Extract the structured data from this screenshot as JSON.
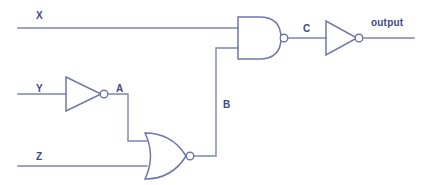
{
  "diagram": {
    "colors": {
      "wire": "#7b85b5",
      "gate_outline": "#6d77ad",
      "label_text": "#3c4a86",
      "background": "#ffffff"
    },
    "inputs": [
      {
        "id": "x",
        "label": "X",
        "x": 36,
        "y": 11,
        "wire_y": 28
      },
      {
        "id": "y",
        "label": "Y",
        "x": 36,
        "y": 84,
        "wire_y": 94
      },
      {
        "id": "z",
        "label": "Z",
        "x": 36,
        "y": 152,
        "wire_y": 166
      }
    ],
    "nodes": [
      {
        "id": "a",
        "label": "A",
        "x": 116,
        "y": 84
      },
      {
        "id": "b",
        "label": "B",
        "x": 223,
        "y": 100
      },
      {
        "id": "c",
        "label": "C",
        "x": 303,
        "y": 24
      }
    ],
    "outputs": [
      {
        "id": "output",
        "label": "output",
        "x": 371,
        "y": 18
      }
    ],
    "gates": [
      {
        "id": "not-1",
        "type": "NOT",
        "name": "inverter-y",
        "inputs": [
          "Y"
        ],
        "output": "A"
      },
      {
        "id": "nor-1",
        "type": "NOR",
        "name": "nor-gate",
        "inputs": [
          "A",
          "Z"
        ],
        "output": "B"
      },
      {
        "id": "nand-1",
        "type": "NAND",
        "name": "nand-gate",
        "inputs": [
          "X",
          "B"
        ],
        "output": "C"
      },
      {
        "id": "not-2",
        "type": "NOT",
        "name": "inverter-c",
        "inputs": [
          "C"
        ],
        "output": "output"
      }
    ]
  }
}
